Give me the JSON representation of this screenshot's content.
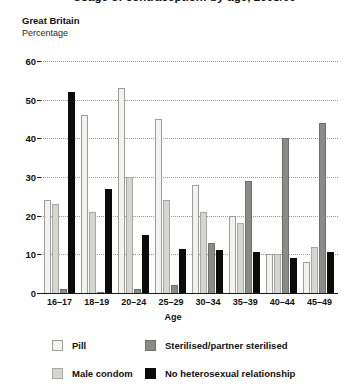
{
  "title": "Usage of contraception: by age, 2008/09",
  "subtitle": {
    "region": "Great Britain",
    "units": "Percentage"
  },
  "chart_data": {
    "type": "bar",
    "title": "Usage of contraception: by age, 2008/09",
    "subtitle": "Great Britain",
    "xlabel": "Age",
    "ylabel": "Percentage",
    "ylim": [
      0,
      60
    ],
    "yticks": [
      0,
      10,
      20,
      30,
      40,
      50,
      60
    ],
    "grid": true,
    "legend_position": "bottom",
    "categories": [
      "16–17",
      "18–19",
      "20–24",
      "25–29",
      "30–34",
      "35–39",
      "40–44",
      "45–49"
    ],
    "series": [
      {
        "name": "Pill",
        "color": "#f2f2f0",
        "values": [
          24,
          46,
          53,
          45,
          28,
          20,
          10,
          8
        ]
      },
      {
        "name": "Male condom",
        "color": "#d5d5d1",
        "values": [
          23,
          21,
          30,
          24,
          21,
          18,
          10,
          12
        ]
      },
      {
        "name": "Sterilised/partner sterilised",
        "color": "#8a8a88",
        "values": [
          1,
          0,
          1,
          2,
          13,
          29,
          40,
          44
        ]
      },
      {
        "name": "No heterosexual relationship",
        "color": "#0b0b0b",
        "values": [
          52,
          27,
          15,
          11.5,
          11,
          10.5,
          9,
          10.5
        ]
      }
    ]
  }
}
